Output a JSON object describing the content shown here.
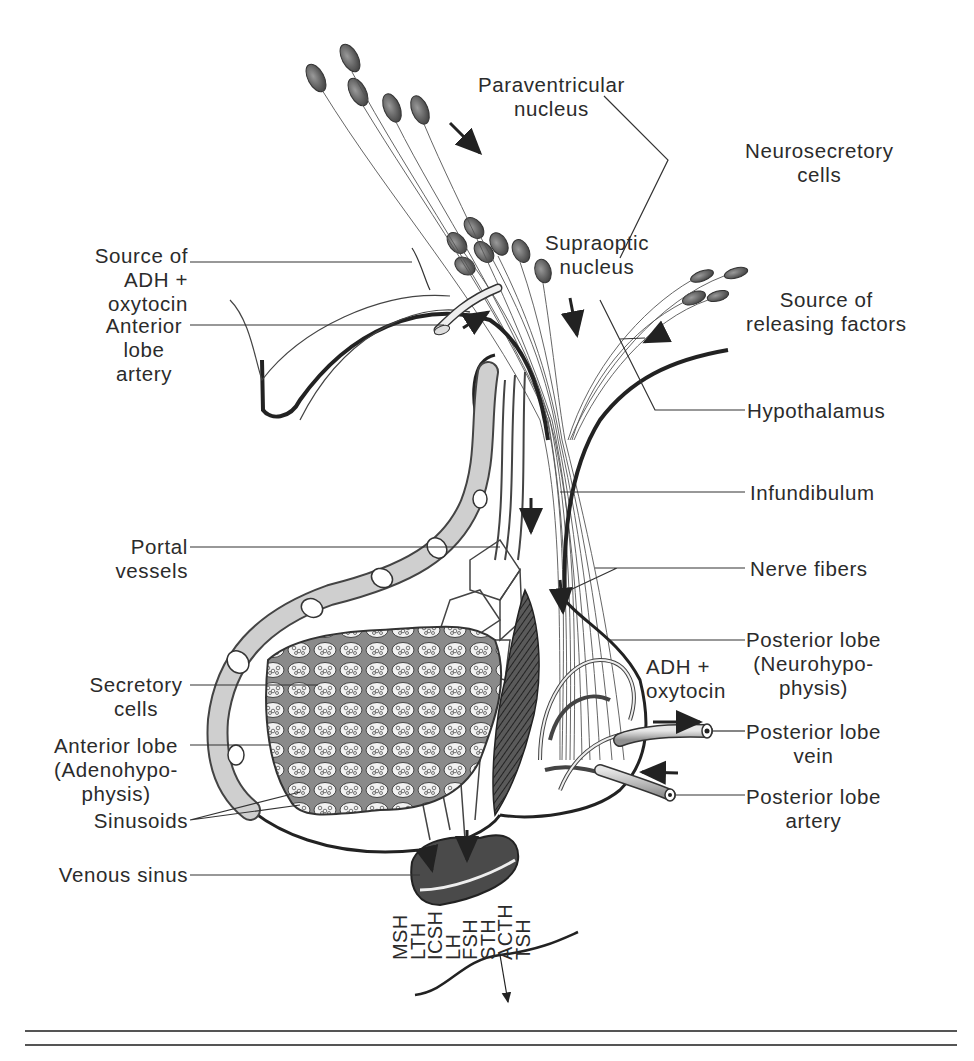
{
  "figure": {
    "labels": {
      "paraventricular_nucleus": [
        "Paraventricular",
        "nucleus"
      ],
      "neurosecretory_cells": [
        "Neurosecretory",
        "cells"
      ],
      "supraoptic_nucleus": [
        "Supraoptic",
        "nucleus"
      ],
      "source_adh_oxytocin": [
        "Source of",
        "ADH +",
        "oxytocin"
      ],
      "anterior_lobe_artery": [
        "Anterior",
        "lobe",
        "artery"
      ],
      "source_releasing_factors": [
        "Source of",
        "releasing factors"
      ],
      "hypothalamus": [
        "Hypothalamus"
      ],
      "infundibulum": [
        "Infundibulum"
      ],
      "portal_vessels": [
        "Portal",
        "vessels"
      ],
      "nerve_fibers": [
        "Nerve fibers"
      ],
      "posterior_lobe": [
        "Posterior lobe",
        "(Neurohypo-",
        "physis)"
      ],
      "adh_oxytocin_release": [
        "ADH +",
        "oxytocin"
      ],
      "secretory_cells": [
        "Secretory",
        "cells"
      ],
      "anterior_lobe": [
        "Anterior lobe",
        "(Adenohypo-",
        "physis)"
      ],
      "posterior_lobe_vein": [
        "Posterior lobe",
        "vein"
      ],
      "sinusoids": [
        "Sinusoids"
      ],
      "posterior_lobe_artery": [
        "Posterior lobe",
        "artery"
      ],
      "venous_sinus": [
        "Venous sinus"
      ]
    },
    "hormones": [
      "TSH",
      "ACTH",
      "STH",
      "FSH",
      "LH",
      "ICSH",
      "LTH",
      "MSH"
    ],
    "colors": {
      "ink": "#2b2b2b",
      "vessel_fill": "#c8c8c8",
      "cell_fill": "#7a7a7a",
      "tissue_fill": "#9a9a9a",
      "background": "#ffffff"
    }
  }
}
